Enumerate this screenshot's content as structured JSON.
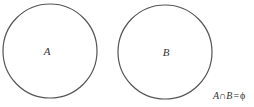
{
  "diagram": {
    "type": "venn-disjoint-sets",
    "stroke_color": "#555555",
    "background": "#ffffff",
    "sets": [
      {
        "label": "A",
        "cx": 50,
        "cy": 51,
        "r": 47
      },
      {
        "label": "B",
        "cx": 165,
        "cy": 52,
        "r": 47
      }
    ],
    "formula": {
      "left": "A",
      "op": "∩",
      "right": "B",
      "eq": "=",
      "result": "ϕ",
      "full": "A∩B=ϕ"
    }
  }
}
